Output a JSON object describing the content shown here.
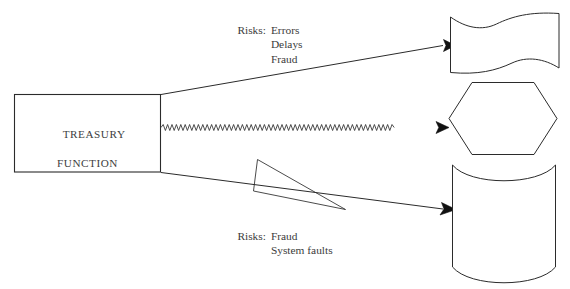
{
  "document": {
    "title": "Treasury Function Risk Diagram",
    "background_color": "#ffffff",
    "ink_color": "#2b2b2b",
    "text_color": "#3b3b3b",
    "width": 570,
    "height": 289
  },
  "process_box": {
    "label_line_1": "TREASURY",
    "label_line_2": "FUNCTION",
    "shape": "rectangle"
  },
  "annotations": {
    "top": {
      "label": "Risks:",
      "items": [
        "Errors",
        "Delays",
        "Fraud"
      ]
    },
    "bottom": {
      "label": "Risks:",
      "items": [
        "Fraud",
        "System faults"
      ]
    }
  },
  "targets": [
    {
      "id": "wavy-document",
      "shape": "wavy-document",
      "label": ""
    },
    {
      "id": "hexagon",
      "shape": "hexagon",
      "label": ""
    },
    {
      "id": "cylinder",
      "shape": "cylinder",
      "label": ""
    }
  ],
  "connectors": [
    {
      "id": "connector-top",
      "style": "straight-arrow",
      "from": "process_box",
      "to": "wavy-document"
    },
    {
      "id": "connector-middle",
      "style": "zigzag-arrow",
      "from": "process_box",
      "to": "hexagon"
    },
    {
      "id": "connector-bottom",
      "style": "straight-arrow",
      "from": "process_box",
      "to": "cylinder"
    }
  ],
  "leader": {
    "id": "leader-pointer",
    "shape": "thin-triangle",
    "points_to": "connector-bottom"
  },
  "ghost_artifacts": {
    "left": "g",
    "middle": "p"
  }
}
